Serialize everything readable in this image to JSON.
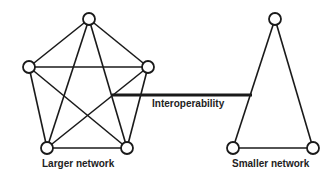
{
  "diagram": {
    "larger_network": {
      "label": "Larger network",
      "nodes": [
        [
          89,
          19
        ],
        [
          29,
          67
        ],
        [
          148,
          67
        ],
        [
          47,
          148
        ],
        [
          127,
          148
        ]
      ],
      "topology": "complete graph (5 nodes)"
    },
    "smaller_network": {
      "label": "Smaller network",
      "nodes": [
        [
          275,
          19
        ],
        [
          233,
          148
        ],
        [
          313,
          148
        ]
      ],
      "topology": "triangle (3 nodes)"
    },
    "link": {
      "label": "Interoperability",
      "from": [
        112,
        95
      ],
      "to": [
        252,
        95
      ]
    },
    "colors": {
      "stroke": "#1a1a1a",
      "background": "#ffffff"
    }
  }
}
